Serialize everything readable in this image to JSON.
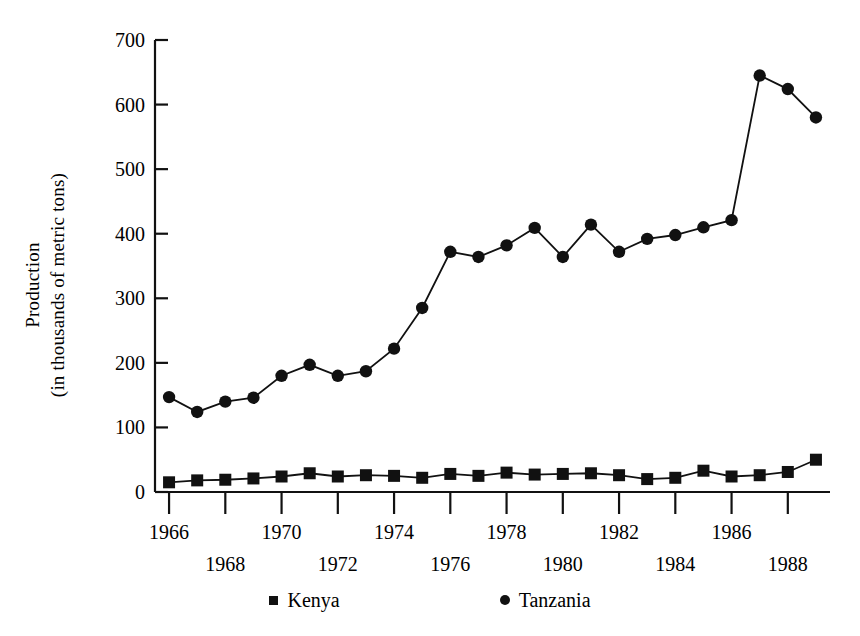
{
  "chart_data": {
    "type": "line",
    "title": "",
    "subtitle": "",
    "xlabel": "",
    "ylabel": "Production\n(in thousands of metric tons)",
    "ylabel_line1": "Production",
    "ylabel_line2": "(in thousands of metric tons)",
    "x": [
      1966,
      1967,
      1968,
      1969,
      1970,
      1971,
      1972,
      1973,
      1974,
      1975,
      1976,
      1977,
      1978,
      1979,
      1980,
      1981,
      1982,
      1983,
      1984,
      1985,
      1986,
      1987,
      1988,
      1989
    ],
    "xlim": [
      1965.5,
      1989.5
    ],
    "ylim": [
      0,
      700
    ],
    "yticks": [
      0,
      100,
      200,
      300,
      400,
      500,
      600,
      700
    ],
    "ytick_labels": [
      "0",
      "100",
      "200",
      "300",
      "400",
      "500",
      "600",
      "700"
    ],
    "xticks": [
      1966,
      1967,
      1968,
      1969,
      1970,
      1971,
      1972,
      1973,
      1974,
      1975,
      1976,
      1977,
      1978,
      1979,
      1980,
      1981,
      1982,
      1983,
      1984,
      1985,
      1986,
      1987,
      1988,
      1989
    ],
    "xtick_labels_upper": [
      "1966",
      "1970",
      "1974",
      "1978",
      "1982",
      "1986"
    ],
    "xtick_labels_lower": [
      "1968",
      "1972",
      "1976",
      "1980",
      "1984",
      "1988"
    ],
    "xtick_labels_all": [
      "1966",
      "1968",
      "1970",
      "1972",
      "1974",
      "1976",
      "1978",
      "1980",
      "1982",
      "1984",
      "1986",
      "1988"
    ],
    "grid": false,
    "legend_position": "bottom",
    "series": [
      {
        "name": "Kenya",
        "marker": "square",
        "color": "#111111",
        "values": [
          15,
          18,
          19,
          21,
          24,
          29,
          24,
          26,
          25,
          22,
          28,
          25,
          30,
          27,
          28,
          29,
          26,
          20,
          22,
          33,
          24,
          26,
          31,
          50
        ]
      },
      {
        "name": "Tanzania",
        "marker": "circle",
        "color": "#111111",
        "values": [
          147,
          124,
          140,
          146,
          180,
          197,
          180,
          187,
          222,
          285,
          372,
          364,
          382,
          409,
          364,
          414,
          372,
          392,
          398,
          410,
          421,
          645,
          624,
          580
        ]
      }
    ]
  },
  "legend": {
    "items": [
      {
        "label": "Kenya",
        "marker": "square"
      },
      {
        "label": "Tanzania",
        "marker": "circle"
      }
    ]
  },
  "axes": {
    "y_axis_name": "production-axis",
    "x_axis_name": "year-axis"
  }
}
